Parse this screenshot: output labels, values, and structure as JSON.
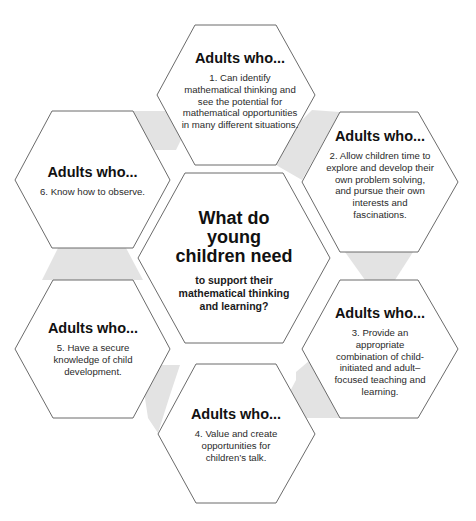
{
  "diagram": {
    "type": "hexagon-cluster",
    "colors": {
      "hex_fill": "#ffffff",
      "hex_stroke": "#6b6b6b",
      "connector_fill": "#e3e3e3",
      "text": "#1a1a1a"
    },
    "center": {
      "title": "What do young children need",
      "subtitle": "to support their mathematical thinking and learning?"
    },
    "outer": [
      {
        "id": 1,
        "heading": "Adults who...",
        "text": "1. Can identify mathematical thinking and see the potential for mathematical opportunities in many different situations."
      },
      {
        "id": 2,
        "heading": "Adults who...",
        "text": "2. Allow children time to explore and develop their own problem solving, and pursue their own interests and fascinations."
      },
      {
        "id": 3,
        "heading": "Adults who...",
        "text": "3. Provide an appropriate combination of child-initiated and adult–focused teaching and learning."
      },
      {
        "id": 4,
        "heading": "Adults who...",
        "text": "4. Value and create opportunities for children’s talk."
      },
      {
        "id": 5,
        "heading": "Adults who...",
        "text": "5. Have a secure knowledge of child development."
      },
      {
        "id": 6,
        "heading": "Adults who...",
        "text": "6. Know how to observe."
      }
    ]
  }
}
